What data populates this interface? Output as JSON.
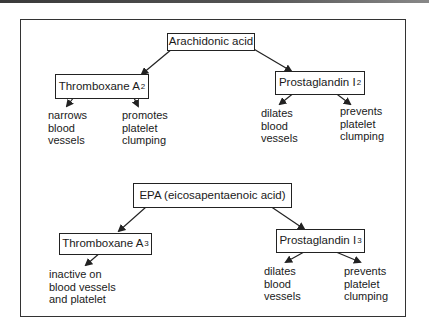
{
  "diagram": {
    "top": {
      "source": "Arachidonic acid",
      "left_product": {
        "name": "Thromboxane A",
        "subscript": "2"
      },
      "right_product": {
        "name": "Prostaglandin I",
        "subscript": "2"
      },
      "left_effects": [
        "narrows\nblood\nvessels",
        "promotes\nplatelet\nclumping"
      ],
      "right_effects": [
        "dilates\nblood\nvessels",
        "prevents\nplatelet\nclumping"
      ]
    },
    "bottom": {
      "source": "EPA (eicosapentaenoic acid)",
      "left_product": {
        "name": "Thromboxane A",
        "subscript": "3"
      },
      "right_product": {
        "name": "Prostaglandin I",
        "subscript": "3"
      },
      "left_effects": [
        "inactive on\nblood vessels\nand platelet"
      ],
      "right_effects": [
        "dilates\nblood\nvessels",
        "prevents\nplatelet\nclumping"
      ]
    }
  },
  "colors": {
    "line": "#222222",
    "frame": "#333333",
    "background": "#ffffff"
  }
}
